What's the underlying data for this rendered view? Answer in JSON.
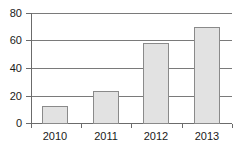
{
  "chart_data": {
    "type": "bar",
    "title": "",
    "xlabel": "",
    "ylabel": "",
    "categories": [
      "2010",
      "2011",
      "2012",
      "2013"
    ],
    "values": [
      12,
      23,
      58,
      70
    ],
    "ylim": [
      0,
      80
    ],
    "yticks": [
      0,
      20,
      40,
      60,
      80
    ],
    "ytick_labels": [
      "0",
      "20",
      "40",
      "60",
      "80"
    ],
    "grid": true,
    "legend": false,
    "series": [
      {
        "name": "",
        "values": [
          12,
          23,
          58,
          70
        ]
      }
    ],
    "colors": {
      "bar_fill": "#e2e2e2",
      "bar_border": "#8a8a8a",
      "axis": "#6b6b6b",
      "grid": "#7a7a7a",
      "text": "#1a1a1a",
      "background": "#ffffff"
    }
  }
}
